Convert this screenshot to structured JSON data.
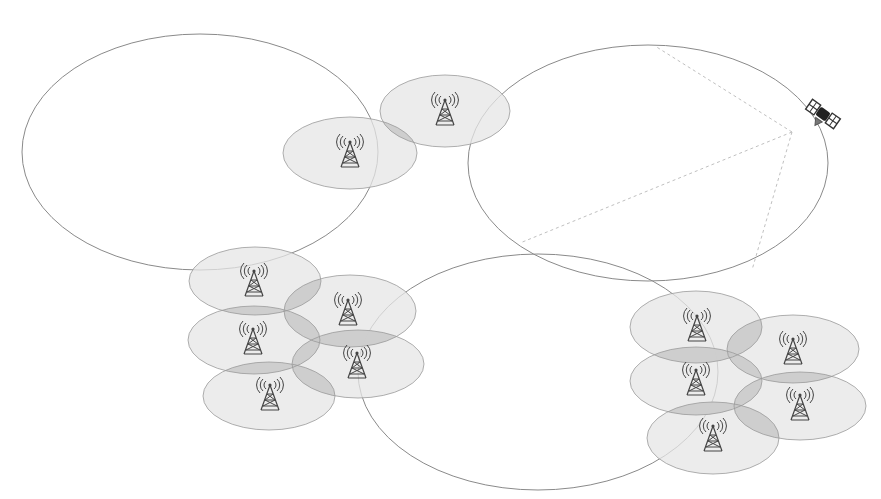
{
  "diagram": {
    "type": "cellular-network-coverage",
    "colors": {
      "background": "#ffffff",
      "outline": "#8a8a8a",
      "cell_fill": "#e6e6e6",
      "overlap_fill": "#c8c8c8",
      "beam": "#c0c0c0",
      "icon": "#444444"
    },
    "macro_cells": [
      {
        "id": "macro-left",
        "cx": 200,
        "cy": 152,
        "rx": 178,
        "ry": 118
      },
      {
        "id": "macro-right",
        "cx": 648,
        "cy": 163,
        "rx": 180,
        "ry": 118
      },
      {
        "id": "macro-bottom",
        "cx": 538,
        "cy": 372,
        "rx": 180,
        "ry": 118
      }
    ],
    "small_cells": [
      {
        "id": "cell-top-1",
        "cx": 350,
        "cy": 153,
        "rx": 67,
        "ry": 36,
        "tower": {
          "x": 350,
          "y": 150
        }
      },
      {
        "id": "cell-top-2",
        "cx": 445,
        "cy": 111,
        "rx": 65,
        "ry": 36,
        "tower": {
          "x": 445,
          "y": 108
        }
      },
      {
        "id": "cluster-a-1",
        "cx": 255,
        "cy": 281,
        "rx": 66,
        "ry": 34,
        "tower": {
          "x": 254,
          "y": 279
        }
      },
      {
        "id": "cluster-a-2",
        "cx": 350,
        "cy": 311,
        "rx": 66,
        "ry": 36,
        "tower": {
          "x": 348,
          "y": 308
        }
      },
      {
        "id": "cluster-a-3",
        "cx": 254,
        "cy": 340,
        "rx": 66,
        "ry": 34,
        "tower": {
          "x": 253,
          "y": 337
        }
      },
      {
        "id": "cluster-a-4",
        "cx": 358,
        "cy": 364,
        "rx": 66,
        "ry": 34,
        "tower": {
          "x": 357,
          "y": 361
        }
      },
      {
        "id": "cluster-a-5",
        "cx": 269,
        "cy": 396,
        "rx": 66,
        "ry": 34,
        "tower": {
          "x": 270,
          "y": 393
        }
      },
      {
        "id": "cluster-b-1",
        "cx": 696,
        "cy": 327,
        "rx": 66,
        "ry": 36,
        "tower": {
          "x": 697,
          "y": 324
        }
      },
      {
        "id": "cluster-b-2",
        "cx": 793,
        "cy": 349,
        "rx": 66,
        "ry": 34,
        "tower": {
          "x": 793,
          "y": 347
        }
      },
      {
        "id": "cluster-b-3",
        "cx": 696,
        "cy": 381,
        "rx": 66,
        "ry": 34,
        "tower": {
          "x": 696,
          "y": 378
        }
      },
      {
        "id": "cluster-b-4",
        "cx": 800,
        "cy": 406,
        "rx": 66,
        "ry": 34,
        "tower": {
          "x": 800,
          "y": 403
        }
      },
      {
        "id": "cluster-b-5",
        "cx": 713,
        "cy": 438,
        "rx": 66,
        "ry": 36,
        "tower": {
          "x": 713,
          "y": 434
        }
      }
    ],
    "satellite": {
      "x": 823,
      "y": 114,
      "label": "satellite"
    },
    "beams": [
      {
        "from": [
          792,
          132
        ],
        "to": [
          655,
          46
        ]
      },
      {
        "from": [
          792,
          132
        ],
        "to": [
          520,
          243
        ]
      },
      {
        "from": [
          792,
          132
        ],
        "to": [
          752,
          270
        ]
      }
    ]
  }
}
